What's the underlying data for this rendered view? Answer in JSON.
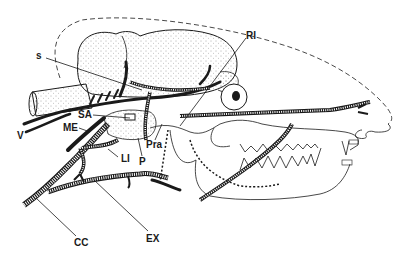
{
  "figure": {
    "colors": {
      "ink": "#1a1a1a",
      "stipple": "#555555",
      "background": "#ffffff"
    },
    "labels": [
      {
        "id": "s",
        "text": "s",
        "x": 36,
        "y": 51
      },
      {
        "id": "RI",
        "text": "RI",
        "x": 246,
        "y": 31
      },
      {
        "id": "SA",
        "text": "SA",
        "x": 78,
        "y": 110
      },
      {
        "id": "ME",
        "text": "ME",
        "x": 63,
        "y": 123
      },
      {
        "id": "V",
        "text": "V",
        "x": 17,
        "y": 131
      },
      {
        "id": "Pra",
        "text": "Pra",
        "x": 146,
        "y": 140
      },
      {
        "id": "LI",
        "text": "LI",
        "x": 121,
        "y": 154
      },
      {
        "id": "P",
        "text": "P",
        "x": 139,
        "y": 157
      },
      {
        "id": "CC",
        "text": "CC",
        "x": 74,
        "y": 238
      },
      {
        "id": "EX",
        "text": "EX",
        "x": 146,
        "y": 234
      }
    ]
  }
}
